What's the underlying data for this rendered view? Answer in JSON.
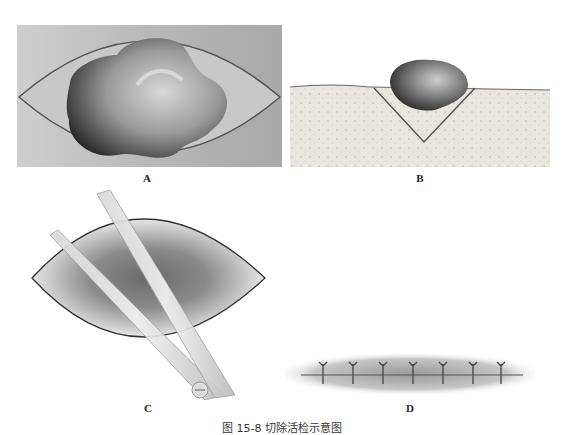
{
  "figure": {
    "caption": "图 15-8  切除活检示意图",
    "panels": [
      {
        "id": "A",
        "label": "A",
        "description": "Elliptical excision outline around lesion (top view)"
      },
      {
        "id": "B",
        "label": "B",
        "description": "V-shaped wedge excision beneath lesion (cross-section)"
      },
      {
        "id": "C",
        "label": "C",
        "description": "Scissors cutting elliptical tissue specimen"
      },
      {
        "id": "D",
        "label": "D",
        "description": "Closed incision with interrupted sutures"
      }
    ],
    "colors": {
      "outline": "#555555",
      "skin_bg": "#bdbdbd",
      "tissue": "#e8e4de",
      "lesion_dark": "#2a2a2a"
    },
    "suture_count": 7
  }
}
